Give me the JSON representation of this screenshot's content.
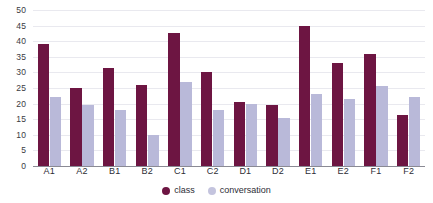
{
  "chart_data": {
    "type": "bar",
    "title": "",
    "subtitle": "",
    "xlabel": "",
    "ylabel": "",
    "ylim": [
      0,
      50
    ],
    "yticks": [
      0,
      5,
      10,
      15,
      20,
      25,
      30,
      35,
      40,
      45,
      50
    ],
    "grid": true,
    "legend_position": "bottom-center",
    "categories": [
      "A1",
      "A2",
      "B1",
      "B2",
      "C1",
      "C2",
      "D1",
      "D2",
      "E1",
      "E2",
      "F1",
      "F2"
    ],
    "series": [
      {
        "name": "class",
        "color": "#6d1542",
        "values": [
          39,
          25,
          31.5,
          26,
          42.5,
          30,
          20.5,
          19.5,
          45,
          33,
          36,
          16.5
        ]
      },
      {
        "name": "conversation",
        "color": "#b9b9d9",
        "values": [
          22,
          19.5,
          18,
          10,
          27,
          18,
          20,
          15.5,
          23,
          21.5,
          25.5,
          22
        ]
      }
    ]
  },
  "legend": {
    "items": [
      {
        "label": "class",
        "swatch": "series-class"
      },
      {
        "label": "conversation",
        "swatch": "series-conversation"
      }
    ]
  },
  "colors": {
    "class": "#6d1542",
    "conversation": "#b9b9d9",
    "gridline": "#e9e9ef",
    "axis": "#8a8a94",
    "text": "#2d2d35",
    "background": "#ffffff"
  }
}
